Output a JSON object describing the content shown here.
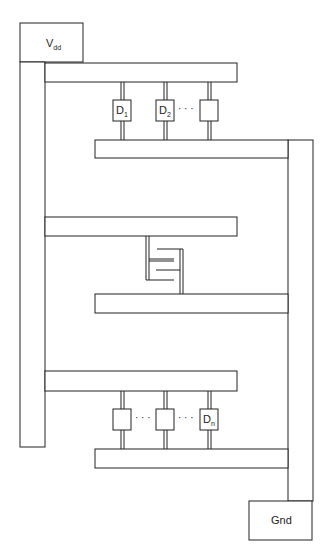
{
  "diagram": {
    "type": "power-distribution-layout",
    "vdd": {
      "label": "V",
      "sub": "dd"
    },
    "gnd": {
      "label": "Gnd"
    },
    "top_devices": [
      {
        "label": "D",
        "sub": "1"
      },
      {
        "label": "D",
        "sub": "2"
      },
      {
        "label": "",
        "sub": ""
      }
    ],
    "top_ellipsis": "· · ·",
    "bottom_devices": [
      {
        "label": "",
        "sub": ""
      },
      {
        "label": "",
        "sub": ""
      },
      {
        "label": "D",
        "sub": "n"
      }
    ],
    "bottom_ellipsis_1": "· · ·",
    "bottom_ellipsis_2": "· · ·",
    "line_color": "#222222"
  }
}
